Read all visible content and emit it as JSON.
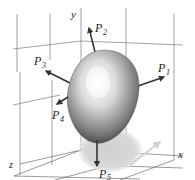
{
  "diagram": {
    "type": "3d-surface-with-normal-vectors",
    "surface": "egg-shaped closed surface",
    "axes": {
      "x": "x",
      "y": "y",
      "z": "z"
    },
    "vectors": [
      {
        "id": "P1",
        "label": "P",
        "subscript": "1"
      },
      {
        "id": "P2",
        "label": "P",
        "subscript": "2"
      },
      {
        "id": "P3",
        "label": "P",
        "subscript": "3"
      },
      {
        "id": "P4",
        "label": "P",
        "subscript": "4"
      },
      {
        "id": "P5",
        "label": "P",
        "subscript": "5"
      }
    ],
    "colors": {
      "grid": "#555555",
      "arrow": "#333333",
      "shadow": "#d6d6d6",
      "surface_light": "#f4f4f4",
      "surface_dark": "#3a3a3a"
    }
  }
}
